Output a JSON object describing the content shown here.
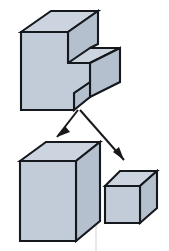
{
  "figure": {
    "type": "technical-illustration",
    "canvas": {
      "width": 169,
      "height": 251,
      "background": "#ffffff"
    }
  },
  "palette": {
    "face_front": "#c2ccd8",
    "face_top": "#ccd5df",
    "face_side": "#b4c0ce",
    "outline": "#15181c",
    "arrow": "#17191d",
    "background": "#ffffff",
    "scan_artifact": "#cfd3d7"
  },
  "shapes": {
    "notched_block": {
      "name": "notched-block",
      "label": "",
      "faces": {
        "front": "21,32 21,110 74,110 74,93 90,82 90,63 68,63 68,32",
        "top": "21,32 51,11 98,11 68,32",
        "notch_top": "68,63 90,48 120,48 90,63",
        "side_upper": "68,32 98,11 98,44 90,48 90,63 68,63",
        "side_lower": "90,63 120,48 120,82 90,97",
        "front_lower_bevel": "74,93 90,82 90,97 74,110"
      }
    },
    "large_box": {
      "name": "large-box",
      "faces": {
        "front": "20,161 20,241 76,241 76,161",
        "top": "20,161 46,142 100,142 76,161",
        "side": "76,161 100,142 100,221 76,241"
      }
    },
    "small_box": {
      "name": "small-box",
      "faces": {
        "front": "105,186 105,223 140,223 140,186",
        "top": "105,186 120,171 157,171 140,186",
        "side": "140,186 157,171 157,208 140,223"
      }
    }
  },
  "arrows": [
    {
      "name": "arrow-to-large-box",
      "from": {
        "x": 78,
        "y": 110
      },
      "to": {
        "x": 57,
        "y": 137
      },
      "head_points": "57,137 65,126 70,132",
      "direction": "down-left"
    },
    {
      "name": "arrow-to-small-box",
      "from": {
        "x": 80,
        "y": 110
      },
      "to": {
        "x": 124,
        "y": 160
      },
      "head_points": "124,160 113,152 119,147",
      "direction": "down-right"
    }
  ],
  "artifacts": {
    "vertical_scan_line": {
      "x": 96,
      "y_start": 150,
      "y_end": 251
    }
  }
}
